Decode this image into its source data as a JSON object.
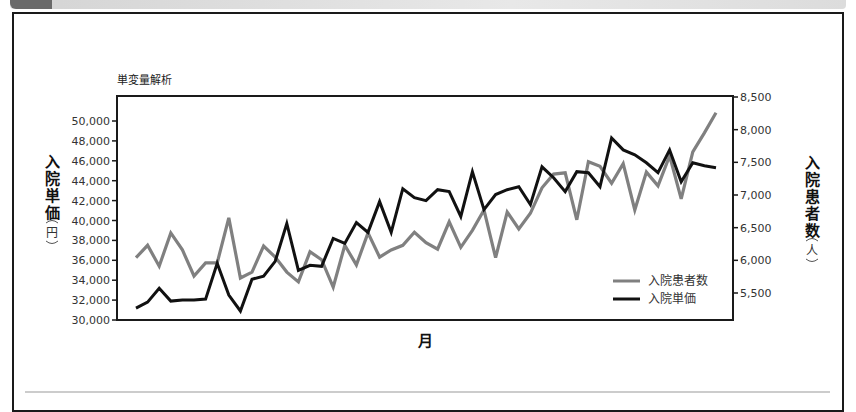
{
  "chart_data": {
    "type": "line",
    "title": "単変量解析",
    "xlabel": "月",
    "ylabel_left": {
      "chars": [
        "入",
        "院",
        "単",
        "価"
      ],
      "unit": "円"
    },
    "ylabel_right": {
      "chars": [
        "入",
        "院",
        "患",
        "者",
        "数"
      ],
      "unit": "人"
    },
    "ylim_left": [
      30000,
      52000
    ],
    "ylim_right": [
      5087,
      8500
    ],
    "yticks_left": [
      {
        "value": 30000,
        "label": "30,000"
      },
      {
        "value": 32000,
        "label": "32,000"
      },
      {
        "value": 34000,
        "label": "34,000"
      },
      {
        "value": 36000,
        "label": "36,000"
      },
      {
        "value": 38000,
        "label": "38,000"
      },
      {
        "value": 40000,
        "label": "40,000"
      },
      {
        "value": 42000,
        "label": "42,000"
      },
      {
        "value": 44000,
        "label": "44,000"
      },
      {
        "value": 46000,
        "label": "46,000"
      },
      {
        "value": 48000,
        "label": "48,000"
      },
      {
        "value": 50000,
        "label": "50,000"
      }
    ],
    "yticks_right": [
      {
        "value": 5500,
        "label": "5,500"
      },
      {
        "value": 6000,
        "label": "6,000"
      },
      {
        "value": 6500,
        "label": "6,500"
      },
      {
        "value": 7000,
        "label": "7,000"
      },
      {
        "value": 7500,
        "label": "7,500"
      },
      {
        "value": 8000,
        "label": "8,000"
      },
      {
        "value": 8500,
        "label": "8,500"
      }
    ],
    "grid": false,
    "legend_position": "bottom-right",
    "series": [
      {
        "name": "入院患者数",
        "axis": "right",
        "color": "#808080",
        "values": [
          6040,
          6230,
          5910,
          6420,
          6160,
          5760,
          5960,
          5960,
          6650,
          5730,
          5820,
          6220,
          6050,
          5820,
          5670,
          6130,
          6010,
          5590,
          6230,
          5930,
          6420,
          6050,
          6160,
          6230,
          6430,
          6270,
          6170,
          6590,
          6200,
          6460,
          6770,
          6040,
          6740,
          6480,
          6720,
          7110,
          7320,
          7340,
          6620,
          7510,
          7440,
          7180,
          7480,
          6770,
          7350,
          7140,
          7600,
          6940,
          7660,
          7950,
          8260
        ]
      },
      {
        "name": "入院単価",
        "axis": "left",
        "color": "#111111",
        "values": [
          31200,
          31800,
          33200,
          31900,
          32000,
          32000,
          32100,
          35700,
          32500,
          30900,
          34100,
          34400,
          35900,
          39700,
          35000,
          35500,
          35400,
          38200,
          37700,
          39800,
          38800,
          41900,
          38800,
          43200,
          42300,
          42000,
          43100,
          42900,
          40400,
          44900,
          41100,
          42600,
          43100,
          43400,
          41600,
          45400,
          44300,
          42900,
          44900,
          44800,
          43400,
          48300,
          47100,
          46600,
          45800,
          44800,
          47100,
          43900,
          45800,
          45500,
          45300
        ]
      }
    ]
  }
}
